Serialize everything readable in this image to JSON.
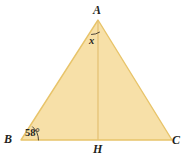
{
  "figure": {
    "type": "geometry-diagram",
    "shape": "triangle",
    "background_color": "#ffffff",
    "fill_color": "#f7e0a8",
    "stroke_color": "#e8c46a",
    "altitude_color": "#e3bf72",
    "mark_color": "#3a332c",
    "label_color": "#231f1c",
    "vertices": {
      "A": {
        "label": "A",
        "x": 98,
        "y": 20
      },
      "B": {
        "label": "B",
        "x": 21,
        "y": 140
      },
      "C": {
        "label": "C",
        "x": 172,
        "y": 140
      },
      "H": {
        "label": "H",
        "x": 98,
        "y": 140
      }
    },
    "segments": [
      {
        "name": "AB",
        "from": "A",
        "to": "B"
      },
      {
        "name": "BC",
        "from": "B",
        "to": "C"
      },
      {
        "name": "CA",
        "from": "C",
        "to": "A"
      },
      {
        "name": "AH",
        "from": "A",
        "to": "H"
      }
    ],
    "angles": [
      {
        "name": "angle-at-A",
        "vertex": "A",
        "label": "x",
        "value": "x",
        "mark": "single-arc",
        "side": "left-of-altitude"
      },
      {
        "name": "angle-at-B",
        "vertex": "B",
        "label": "58°",
        "value": 58,
        "unit": "degrees",
        "mark": "single-arc"
      }
    ]
  }
}
